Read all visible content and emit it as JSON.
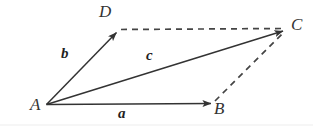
{
  "figure": {
    "background_color": "#ffffff",
    "stroke_color": "#3a3a3a",
    "label_color": "#333333",
    "width": 313,
    "height": 126
  },
  "points": {
    "A": {
      "label": "A",
      "x": 46,
      "y": 105
    },
    "B": {
      "label": "B",
      "x": 213,
      "y": 104
    },
    "C": {
      "label": "C",
      "x": 286,
      "y": 30
    },
    "D": {
      "label": "D",
      "x": 118,
      "y": 31
    }
  },
  "vectors": {
    "a": {
      "label": "a",
      "from": "A",
      "to": "B",
      "style": "solid",
      "arrow": true
    },
    "b": {
      "label": "b",
      "from": "A",
      "to": "D",
      "style": "solid",
      "arrow": true
    },
    "c": {
      "label": "c",
      "from": "A",
      "to": "C",
      "style": "solid",
      "arrow": true
    }
  },
  "construction_lines": [
    {
      "name": "D-to-C",
      "from": "D",
      "to": "C",
      "style": "dashed",
      "arrow": false
    },
    {
      "name": "B-to-C",
      "from": "B",
      "to": "C",
      "style": "dashed",
      "arrow": false
    }
  ]
}
